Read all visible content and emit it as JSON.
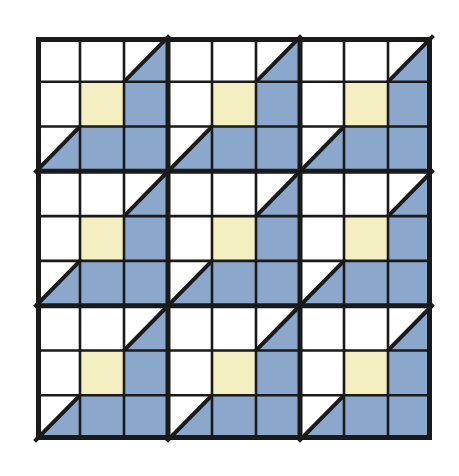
{
  "artwork": {
    "title": "Nine-Patch Quilt Block Grid",
    "description": "A 3 by 3 arrangement of identical quilt blocks, each block itself a 3 by 3 grid of square patches rendered in white, pale yellow and slate blue with black lattice lines.",
    "background_color": "#ffffff"
  },
  "palette": {
    "white": "#ffffff",
    "yellow": "#f4efc0",
    "blue": "#8ba7cc",
    "line": "#1a1a1a"
  },
  "geometry": {
    "canvas_width": 459,
    "canvas_height": 476,
    "grid_left": 36,
    "grid_top": 37,
    "grid_width": 396,
    "grid_height": 403,
    "blocks_across": 3,
    "blocks_down": 3,
    "cells_per_block_across": 3,
    "cells_per_block_down": 3,
    "outer_border_width": 5,
    "block_divider_width": 5,
    "cell_line_width": 2.6,
    "diagonal_line_width": 4
  },
  "block_template": {
    "name": "corner-triangle-nine-patch",
    "rows": [
      [
        {
          "cell": "r0c0",
          "fill": "white",
          "shape": "square"
        },
        {
          "cell": "r0c1",
          "fill": "white",
          "shape": "square"
        },
        {
          "cell": "r0c2",
          "fill": "white",
          "shape": "half-square-triangle",
          "triangle_fill": "blue",
          "diagonal": "bottom-left-to-top-right",
          "filled_half": "lower-right"
        }
      ],
      [
        {
          "cell": "r1c0",
          "fill": "white",
          "shape": "square"
        },
        {
          "cell": "r1c1",
          "fill": "yellow",
          "shape": "square"
        },
        {
          "cell": "r1c2",
          "fill": "blue",
          "shape": "square"
        }
      ],
      [
        {
          "cell": "r2c0",
          "fill": "white",
          "shape": "half-square-triangle",
          "triangle_fill": "blue",
          "diagonal": "bottom-left-to-top-right",
          "filled_half": "lower-right"
        },
        {
          "cell": "r2c1",
          "fill": "blue",
          "shape": "square"
        },
        {
          "cell": "r2c2",
          "fill": "blue",
          "shape": "square"
        }
      ]
    ]
  },
  "blocks": [
    {
      "id": "block-0-0",
      "row": 0,
      "col": 0,
      "label": "Top left block"
    },
    {
      "id": "block-0-1",
      "row": 0,
      "col": 1,
      "label": "Top center block"
    },
    {
      "id": "block-0-2",
      "row": 0,
      "col": 2,
      "label": "Top right block"
    },
    {
      "id": "block-1-0",
      "row": 1,
      "col": 0,
      "label": "Middle left block"
    },
    {
      "id": "block-1-1",
      "row": 1,
      "col": 1,
      "label": "Middle center block"
    },
    {
      "id": "block-1-2",
      "row": 1,
      "col": 2,
      "label": "Middle right block"
    },
    {
      "id": "block-2-0",
      "row": 2,
      "col": 0,
      "label": "Bottom left block"
    },
    {
      "id": "block-2-1",
      "row": 2,
      "col": 1,
      "label": "Bottom center block"
    },
    {
      "id": "block-2-2",
      "row": 2,
      "col": 2,
      "label": "Bottom right block"
    }
  ],
  "counts": {
    "total_blocks": 9,
    "total_cells": 81,
    "white_squares_per_block": 3,
    "yellow_squares_per_block": 1,
    "blue_squares_per_block": 3,
    "triangle_cells_per_block": 2
  }
}
